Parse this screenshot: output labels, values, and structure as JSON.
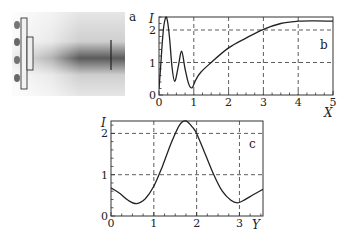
{
  "figure": {
    "panel_a_label": "a",
    "panel_b_label": "b",
    "panel_c_label": "c"
  },
  "chart_data": [
    {
      "id": "b",
      "type": "line",
      "title": "",
      "panel_label": "b",
      "xlabel": "X",
      "ylabel": "I",
      "xlim": [
        0,
        5
      ],
      "ylim": [
        0,
        2.4
      ],
      "xticks": [
        0,
        1,
        2,
        3,
        4,
        5
      ],
      "yticks": [
        0,
        1,
        2
      ],
      "grid": true,
      "series": [
        {
          "name": "I(X)",
          "x": [
            0,
            0.05,
            0.1,
            0.15,
            0.22,
            0.3,
            0.37,
            0.45,
            0.55,
            0.65,
            0.75,
            0.85,
            0.95,
            1.05,
            1.2,
            1.5,
            2.0,
            2.5,
            3.0,
            3.5,
            4.0,
            4.5,
            5.0
          ],
          "values": [
            0.2,
            0.9,
            1.7,
            2.2,
            2.38,
            1.8,
            0.9,
            0.42,
            0.85,
            1.35,
            0.8,
            0.35,
            0.22,
            0.45,
            0.7,
            1.0,
            1.45,
            1.75,
            2.02,
            2.2,
            2.27,
            2.28,
            2.27
          ]
        }
      ]
    },
    {
      "id": "c",
      "type": "line",
      "title": "",
      "panel_label": "c",
      "xlabel": "Y",
      "ylabel": "I",
      "xlim": [
        0,
        3.55
      ],
      "ylim": [
        0,
        2.3
      ],
      "xticks": [
        0,
        1,
        2,
        3
      ],
      "yticks": [
        0,
        1,
        2
      ],
      "grid": true,
      "series": [
        {
          "name": "I(Y)",
          "x": [
            0,
            0.2,
            0.4,
            0.6,
            0.8,
            1.0,
            1.2,
            1.4,
            1.6,
            1.75,
            1.9,
            2.0,
            2.2,
            2.4,
            2.6,
            2.8,
            2.95,
            3.1,
            3.3,
            3.55
          ],
          "values": [
            0.68,
            0.55,
            0.38,
            0.3,
            0.42,
            0.72,
            1.2,
            1.75,
            2.2,
            2.3,
            2.15,
            2.0,
            1.5,
            1.0,
            0.6,
            0.38,
            0.32,
            0.38,
            0.5,
            0.65
          ]
        }
      ]
    }
  ]
}
